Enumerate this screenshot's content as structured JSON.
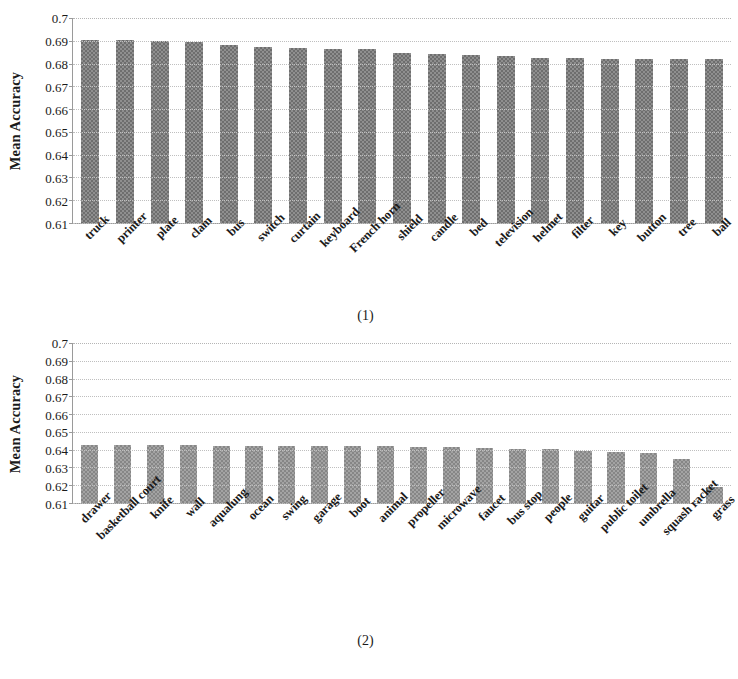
{
  "figure": {
    "panels": [
      {
        "caption": "(1)",
        "ylabel": "Mean Accuracy",
        "yticks": [
          "0.7",
          "0.69",
          "0.68",
          "0.67",
          "0.66",
          "0.65",
          "0.64",
          "0.63",
          "0.62",
          "0.61"
        ]
      },
      {
        "caption": "(2)",
        "ylabel": "Mean Accuracy",
        "yticks": [
          "0.7",
          "0.69",
          "0.68",
          "0.67",
          "0.66",
          "0.65",
          "0.64",
          "0.63",
          "0.62",
          "0.61"
        ]
      }
    ]
  },
  "chart_data": [
    {
      "type": "bar",
      "title": "(1)",
      "xlabel": "",
      "ylabel": "Mean Accuracy",
      "ylim": [
        0.61,
        0.7
      ],
      "ytick_values": [
        0.61,
        0.62,
        0.63,
        0.64,
        0.65,
        0.66,
        0.67,
        0.68,
        0.69,
        0.7
      ],
      "grid": true,
      "legend": "none",
      "categories": [
        "truck",
        "printer",
        "plate",
        "clam",
        "bus",
        "switch",
        "curtain",
        "keyboard",
        "French horn",
        "shield",
        "candle",
        "bed",
        "television",
        "helmet",
        "filter",
        "key",
        "button",
        "tree",
        "ball"
      ],
      "values": [
        0.6905,
        0.6903,
        0.6897,
        0.6893,
        0.688,
        0.6873,
        0.6868,
        0.6865,
        0.6862,
        0.6848,
        0.684,
        0.6838,
        0.6832,
        0.6826,
        0.6823,
        0.6822,
        0.6821,
        0.682,
        0.6818
      ]
    },
    {
      "type": "bar",
      "title": "(2)",
      "xlabel": "",
      "ylabel": "Mean Accuracy",
      "ylim": [
        0.61,
        0.7
      ],
      "ytick_values": [
        0.61,
        0.62,
        0.63,
        0.64,
        0.65,
        0.66,
        0.67,
        0.68,
        0.69,
        0.7
      ],
      "grid": true,
      "legend": "none",
      "categories": [
        "drawer",
        "basketball court",
        "knife",
        "wall",
        "aqualung",
        "ocean",
        "swing",
        "garage",
        "boot",
        "animal",
        "propeller",
        "microwave",
        "faucet",
        "bus stop",
        "people",
        "guitar",
        "public toilet",
        "umbrella",
        "squash racket",
        "grass"
      ],
      "values": [
        0.6428,
        0.6426,
        0.6424,
        0.6424,
        0.6423,
        0.6422,
        0.6422,
        0.6421,
        0.642,
        0.6418,
        0.6417,
        0.6415,
        0.6412,
        0.6406,
        0.6402,
        0.639,
        0.6386,
        0.6384,
        0.6348,
        0.6192
      ]
    }
  ]
}
